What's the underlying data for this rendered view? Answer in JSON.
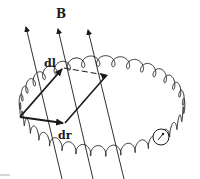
{
  "figure": {
    "labels": {
      "field": "B",
      "dl": "dl",
      "dr": "dr"
    },
    "elements": {
      "field_lines": 3,
      "coil": "toroidal helical coil (elliptical loop of turns)",
      "parallelogram": "formed by vectors dl and dr",
      "meter": "small circle with pointer on coil"
    },
    "colors": {
      "ink": "#1a1a1a",
      "background": "#ffffff"
    }
  }
}
